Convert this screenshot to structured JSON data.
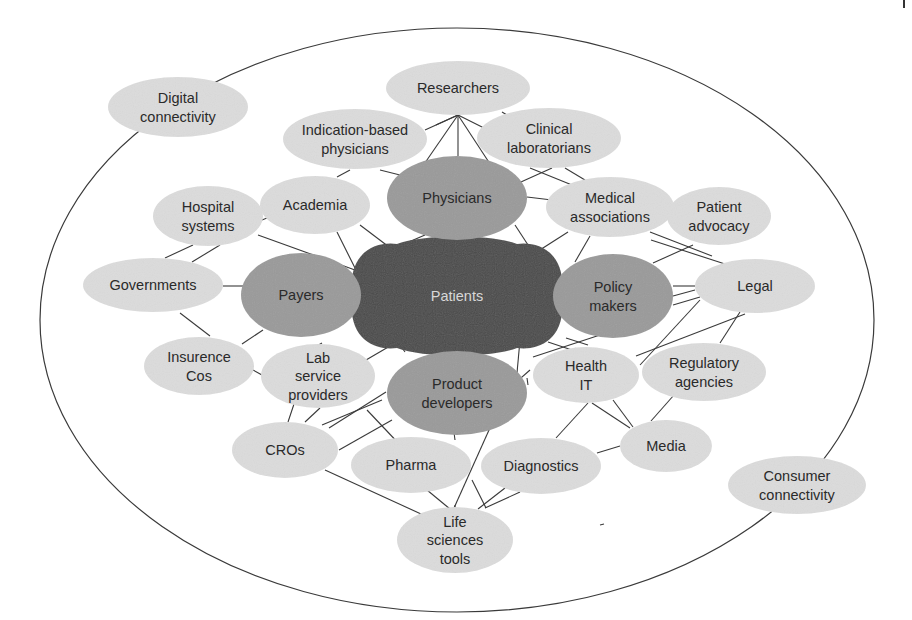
{
  "diagram": {
    "colors": {
      "hub": "#4a4a4a",
      "primary": "#9a9a9a",
      "secondary": "#dcdcdc",
      "edge": "#3a3a3a",
      "hub_text": "#d8d8d8",
      "text": "#2a2a2a"
    },
    "outer_ellipse": {
      "cx": 457,
      "cy": 320,
      "rx": 417,
      "ry": 292
    },
    "hub": {
      "id": "patients",
      "label": "Patients",
      "lines": [
        "Patients"
      ],
      "cx": 457,
      "cy": 296,
      "rx": 105,
      "ry": 58
    },
    "primary_nodes": [
      {
        "id": "physicians",
        "lines": [
          "Physicians"
        ],
        "cx": 457,
        "cy": 198,
        "rx": 70,
        "ry": 42
      },
      {
        "id": "payers",
        "lines": [
          "Payers"
        ],
        "cx": 301,
        "cy": 295,
        "rx": 60,
        "ry": 42
      },
      {
        "id": "policy-makers",
        "lines": [
          "Policy",
          "makers"
        ],
        "cx": 613,
        "cy": 296,
        "rx": 60,
        "ry": 42
      },
      {
        "id": "product-developers",
        "lines": [
          "Product",
          "developers"
        ],
        "cx": 457,
        "cy": 393,
        "rx": 70,
        "ry": 42
      }
    ],
    "secondary_nodes": [
      {
        "id": "researchers",
        "lines": [
          "Researchers"
        ],
        "cx": 458,
        "cy": 88,
        "rx": 72,
        "ry": 27
      },
      {
        "id": "digital-connectivity",
        "lines": [
          "Digital",
          "connectivity"
        ],
        "cx": 178,
        "cy": 107,
        "rx": 70,
        "ry": 30
      },
      {
        "id": "indication-based-physicians",
        "lines": [
          "Indication-based",
          "physicians"
        ],
        "cx": 355,
        "cy": 139,
        "rx": 72,
        "ry": 30
      },
      {
        "id": "clinical-laboratorians",
        "lines": [
          "Clinical",
          "laboratorians"
        ],
        "cx": 549,
        "cy": 138,
        "rx": 72,
        "ry": 30
      },
      {
        "id": "hospital-systems",
        "lines": [
          "Hospital",
          "systems"
        ],
        "cx": 208,
        "cy": 216,
        "rx": 55,
        "ry": 30
      },
      {
        "id": "academia",
        "lines": [
          "Academia"
        ],
        "cx": 315,
        "cy": 205,
        "rx": 55,
        "ry": 29
      },
      {
        "id": "medical-associations",
        "lines": [
          "Medical",
          "associations"
        ],
        "cx": 610,
        "cy": 207,
        "rx": 64,
        "ry": 30
      },
      {
        "id": "patient-advocacy",
        "lines": [
          "Patient",
          "advocacy"
        ],
        "cx": 719,
        "cy": 216,
        "rx": 52,
        "ry": 29
      },
      {
        "id": "governments",
        "lines": [
          "Governments"
        ],
        "cx": 153,
        "cy": 285,
        "rx": 70,
        "ry": 27
      },
      {
        "id": "legal",
        "lines": [
          "Legal"
        ],
        "cx": 755,
        "cy": 286,
        "rx": 60,
        "ry": 27
      },
      {
        "id": "insurence-cos",
        "lines": [
          "Insurence",
          "Cos"
        ],
        "cx": 199,
        "cy": 366,
        "rx": 55,
        "ry": 29
      },
      {
        "id": "lab-service-providers",
        "lines": [
          "Lab",
          "service",
          "providers"
        ],
        "cx": 318,
        "cy": 376,
        "rx": 57,
        "ry": 32
      },
      {
        "id": "health-it",
        "lines": [
          "Health",
          "IT"
        ],
        "cx": 586,
        "cy": 375,
        "rx": 53,
        "ry": 28
      },
      {
        "id": "regulatory-agencies",
        "lines": [
          "Regulatory",
          "agencies"
        ],
        "cx": 704,
        "cy": 372,
        "rx": 62,
        "ry": 29
      },
      {
        "id": "cros",
        "lines": [
          "CROs"
        ],
        "cx": 285,
        "cy": 450,
        "rx": 53,
        "ry": 28
      },
      {
        "id": "pharma",
        "lines": [
          "Pharma"
        ],
        "cx": 411,
        "cy": 465,
        "rx": 60,
        "ry": 28
      },
      {
        "id": "diagnostics",
        "lines": [
          "Diagnostics"
        ],
        "cx": 541,
        "cy": 466,
        "rx": 60,
        "ry": 28
      },
      {
        "id": "media",
        "lines": [
          "Media"
        ],
        "cx": 666,
        "cy": 446,
        "rx": 46,
        "ry": 26
      },
      {
        "id": "consumer-connectivity",
        "lines": [
          "Consumer",
          "connectivity"
        ],
        "cx": 797,
        "cy": 485,
        "rx": 69,
        "ry": 29
      },
      {
        "id": "life-sciences-tools",
        "lines": [
          "Life",
          "sciences",
          "tools"
        ],
        "cx": 455,
        "cy": 540,
        "rx": 58,
        "ry": 33
      }
    ],
    "edges": [
      [
        458,
        115,
        420,
        170
      ],
      [
        458,
        115,
        458,
        156
      ],
      [
        458,
        115,
        494,
        170
      ],
      [
        458,
        115,
        425,
        130
      ],
      [
        458,
        115,
        488,
        130
      ],
      [
        458,
        115,
        436,
        125
      ],
      [
        502,
        112,
        507,
        115
      ],
      [
        380,
        170,
        400,
        175
      ],
      [
        350,
        170,
        337,
        177
      ],
      [
        530,
        168,
        572,
        185
      ],
      [
        552,
        168,
        512,
        186
      ],
      [
        565,
        168,
        585,
        180
      ],
      [
        527,
        197,
        552,
        200
      ],
      [
        515,
        225,
        530,
        248
      ],
      [
        568,
        232,
        532,
        255
      ],
      [
        590,
        236,
        575,
        262
      ],
      [
        258,
        235,
        355,
        270
      ],
      [
        262,
        220,
        267,
        218
      ],
      [
        193,
        245,
        165,
        258
      ],
      [
        220,
        245,
        192,
        262
      ],
      [
        223,
        286,
        243,
        286
      ],
      [
        337,
        232,
        355,
        268
      ],
      [
        360,
        225,
        393,
        250
      ],
      [
        425,
        235,
        362,
        262
      ],
      [
        180,
        313,
        210,
        336
      ],
      [
        263,
        330,
        242,
        344
      ],
      [
        253,
        370,
        262,
        375
      ],
      [
        322,
        343,
        315,
        347
      ],
      [
        366,
        360,
        390,
        346
      ],
      [
        400,
        345,
        405,
        352
      ],
      [
        650,
        232,
        712,
        256
      ],
      [
        651,
        240,
        725,
        264
      ],
      [
        693,
        245,
        653,
        263
      ],
      [
        673,
        286,
        695,
        286
      ],
      [
        673,
        296,
        695,
        290
      ],
      [
        673,
        305,
        700,
        297
      ],
      [
        700,
        300,
        640,
        365
      ],
      [
        740,
        312,
        720,
        343
      ],
      [
        636,
        356,
        745,
        314
      ],
      [
        617,
        365,
        548,
        342
      ],
      [
        600,
        335,
        533,
        357
      ],
      [
        588,
        345,
        566,
        338
      ],
      [
        585,
        360,
        575,
        348
      ],
      [
        530,
        370,
        505,
        392
      ],
      [
        528,
        385,
        527,
        378
      ],
      [
        520,
        340,
        515,
        395
      ],
      [
        588,
        403,
        556,
        438
      ],
      [
        592,
        403,
        630,
        428
      ],
      [
        613,
        400,
        633,
        427
      ],
      [
        674,
        395,
        651,
        421
      ],
      [
        620,
        446,
        597,
        453
      ],
      [
        288,
        422,
        294,
        404
      ],
      [
        305,
        422,
        320,
        408
      ],
      [
        767,
        393,
        767,
        393
      ],
      [
        382,
        400,
        322,
        425
      ],
      [
        386,
        392,
        329,
        428
      ],
      [
        392,
        420,
        339,
        450
      ],
      [
        367,
        410,
        402,
        447
      ],
      [
        325,
        470,
        432,
        519
      ],
      [
        427,
        490,
        450,
        509
      ],
      [
        450,
        402,
        455,
        440
      ],
      [
        455,
        505,
        455,
        531
      ],
      [
        498,
        410,
        454,
        508
      ],
      [
        472,
        480,
        486,
        508
      ],
      [
        505,
        488,
        478,
        509
      ],
      [
        520,
        492,
        485,
        508
      ],
      [
        442,
        380,
        430,
        387
      ],
      [
        493,
        377,
        475,
        372
      ],
      [
        600,
        525,
        604,
        524
      ],
      [
        762,
        148,
        762,
        148
      ],
      [
        892,
        254,
        892,
        254
      ]
    ],
    "outer_labels": [
      "Digital connectivity",
      "Consumer connectivity"
    ]
  }
}
